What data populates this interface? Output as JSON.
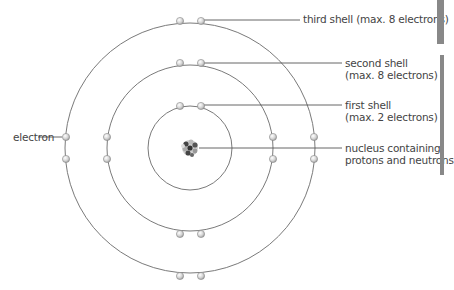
{
  "diagram": {
    "colors": {
      "orbit": "#777777",
      "leader_line": "#555555",
      "electron_fill": "#d8d8d8",
      "electron_highlight": "#ffffff",
      "electron_stroke": "#8a8a8a",
      "nucleus_dark": "#3a3a3a",
      "nucleus_light": "#bdbdbd",
      "text": "#444444",
      "edge_tab": "#8a8a8a"
    },
    "center": [
      190,
      145
    ],
    "shells": [
      {
        "name": "first shell",
        "radius": 42,
        "electron_count": 2
      },
      {
        "name": "second shell",
        "radius": 83,
        "electron_count": 8
      },
      {
        "name": "third shell",
        "radius": 125,
        "electron_count": 8
      }
    ],
    "labels": {
      "third_shell": "third shell (max. 8 electrons)",
      "second_shell_line1": "second shell",
      "second_shell_line2": "(max. 8 electrons)",
      "first_shell_line1": "first shell",
      "first_shell_line2": "(max. 2 electrons)",
      "nucleus_line1": "nucleus containing",
      "nucleus_line2": "protons and neutrons",
      "electron": "electron"
    }
  }
}
